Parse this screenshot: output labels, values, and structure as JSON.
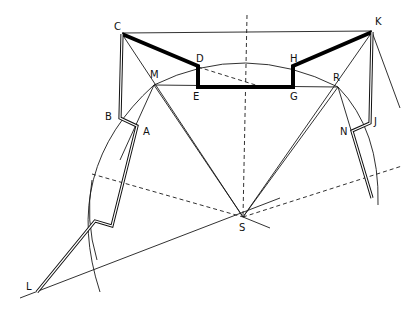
{
  "diagram": {
    "labels": {
      "C": "C",
      "D": "D",
      "E": "E",
      "G": "G",
      "H": "H",
      "K": "K",
      "M": "M",
      "R": "R",
      "B": "B",
      "A": "A",
      "N": "N",
      "J": "J",
      "S": "S",
      "L": "L"
    }
  }
}
